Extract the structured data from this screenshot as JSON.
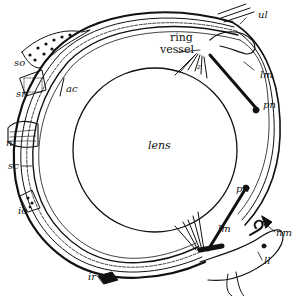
{
  "figure": {
    "background_color": "#ffffff",
    "ink_color": "#111111",
    "labels": {
      "ul": "ul",
      "ring_vessel_line1": "ring",
      "ring_vessel_line2": "vessel",
      "lm_upper": "lm",
      "pn_upper": "pn",
      "z": "z",
      "lens": "lens",
      "so": "so",
      "sr": "sr",
      "ac": "ac",
      "n": "n",
      "sc": "sc",
      "io": "io",
      "pn_lower": "pn",
      "lm_lower": "lm",
      "nm": "nm",
      "ll": "ll",
      "ir": "ir"
    }
  }
}
